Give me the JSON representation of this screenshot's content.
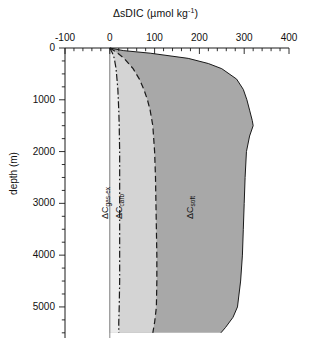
{
  "chart_data": {
    "type": "area",
    "xlabel": "ΔsDIC (µmol kg⁻¹)",
    "ylabel": "depth (m)",
    "orientation": "vertical-profile",
    "xlim": [
      -100,
      400
    ],
    "ylim": [
      0,
      5600
    ],
    "y_inverted": true,
    "grid": false,
    "legend": "inline-annotations",
    "xticks": [
      -100,
      0,
      100,
      200,
      300,
      400
    ],
    "xtick_labels": [
      "-100",
      "0",
      "100",
      "200",
      "300",
      "400"
    ],
    "x_minor_tick_interval": 20,
    "yticks": [
      0,
      1000,
      2000,
      3000,
      4000,
      5000
    ],
    "ytick_labels": [
      "0",
      "1000",
      "2000",
      "3000",
      "4000",
      "5000"
    ],
    "y_minor_tick_interval": 250,
    "colors": {
      "gas_ex_fill": "#ededed",
      "carb_fill": "#d4d4d4",
      "soft_fill": "#a8a8a8",
      "axis": "#1a1a1a",
      "curve": "#1a1a1a"
    },
    "annotations": [
      {
        "id": "gas-ex-label",
        "text": "ΔC",
        "sub": "gas-ex",
        "depth": 3100,
        "x_value": 10
      },
      {
        "id": "carb-label",
        "text": "ΔC",
        "sub": "carb",
        "depth": 3100,
        "x_value": 40
      },
      {
        "id": "soft-label",
        "text": "ΔC",
        "sub": "soft",
        "depth": 3100,
        "x_value": 200
      }
    ],
    "series": [
      {
        "name": "ΔC_gas-ex",
        "style": "dash-dot",
        "fill": "#ededed",
        "depths": [
          0,
          100,
          200,
          400,
          600,
          800,
          1000,
          1200,
          1500,
          2000,
          2500,
          3000,
          3500,
          4000,
          4500,
          5000,
          5300,
          5500
        ],
        "values": [
          0,
          6,
          10,
          14,
          16,
          18,
          19,
          20,
          21,
          22,
          22,
          22,
          22,
          22,
          22,
          21,
          20,
          20
        ]
      },
      {
        "name": "ΔC_carb",
        "style": "dashed",
        "fill": "#d4d4d4",
        "depths": [
          0,
          100,
          200,
          400,
          600,
          800,
          1000,
          1200,
          1500,
          2000,
          2500,
          3000,
          3500,
          4000,
          4500,
          5000,
          5300,
          5500
        ],
        "values": [
          0,
          18,
          32,
          52,
          66,
          76,
          84,
          90,
          96,
          100,
          102,
          103,
          104,
          105,
          105,
          104,
          100,
          96
        ]
      },
      {
        "name": "ΔC_soft",
        "style": "solid",
        "fill": "#a8a8a8",
        "depths": [
          0,
          50,
          100,
          200,
          300,
          400,
          600,
          800,
          1000,
          1200,
          1400,
          1500,
          1700,
          2000,
          2500,
          3000,
          3500,
          4000,
          4500,
          5000,
          5200,
          5400,
          5500
        ],
        "values": [
          0,
          30,
          90,
          175,
          220,
          250,
          283,
          298,
          306,
          312,
          318,
          320,
          312,
          305,
          302,
          300,
          298,
          296,
          292,
          285,
          275,
          258,
          248
        ]
      }
    ]
  }
}
